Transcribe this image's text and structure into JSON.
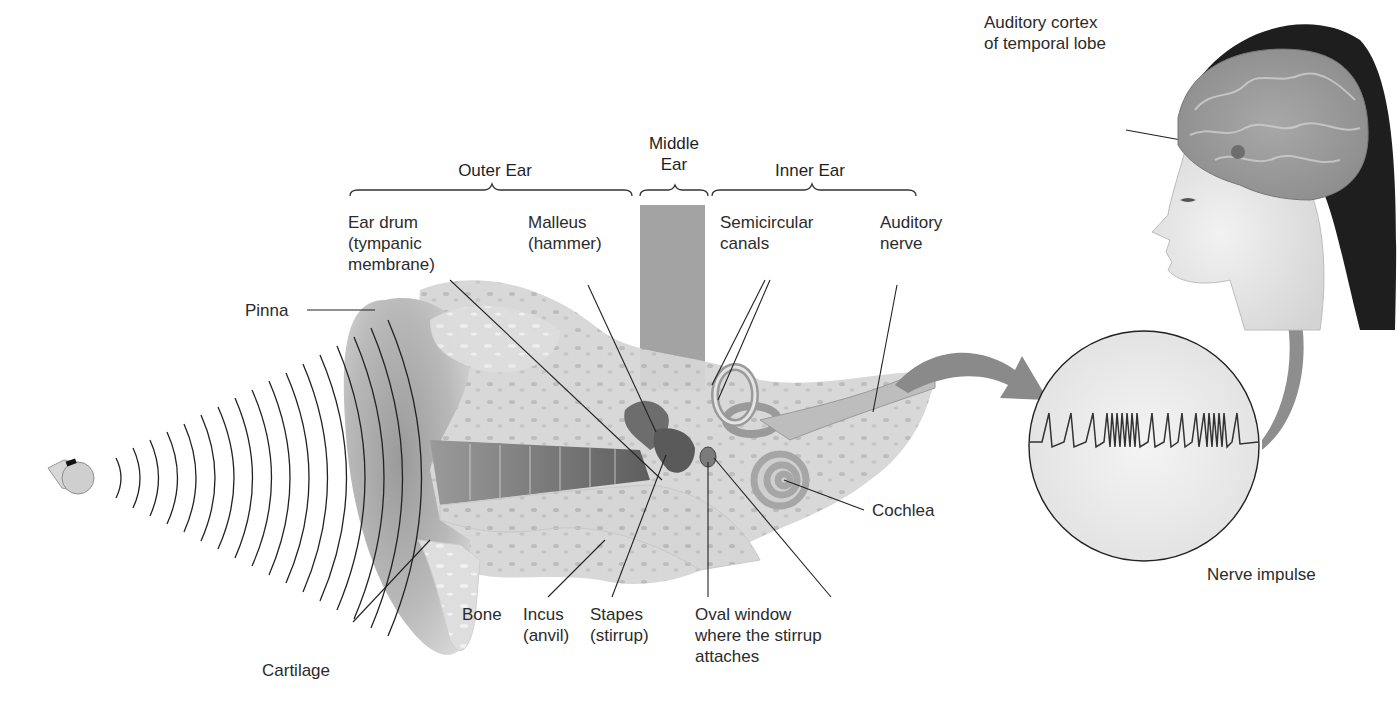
{
  "diagram": {
    "sections": {
      "outer_ear": "Outer Ear",
      "middle_ear": "Middle\nEar",
      "inner_ear": "Inner Ear"
    },
    "labels": {
      "ear_drum": "Ear drum\n(tympanic\nmembrane)",
      "malleus": "Malleus\n(hammer)",
      "semicircular_canals": "Semicircular\ncanals",
      "auditory_nerve": "Auditory\nnerve",
      "pinna": "Pinna",
      "cochlea": "Cochlea",
      "cartilage": "Cartilage",
      "bone": "Bone",
      "incus": "Incus\n(anvil)",
      "stapes": "Stapes\n(stirrup)",
      "oval_window": "Oval window\nwhere the stirrup\nattaches",
      "auditory_cortex": "Auditory cortex\nof temporal lobe",
      "nerve_impulse": "Nerve impulse"
    },
    "icons": {
      "sound_source": "whistle-icon",
      "sound_waves": "sound-wave-arcs",
      "head": "human-head-profile-with-brain",
      "inset": "nerve-impulse-circle-inset",
      "arrows": [
        "curved-arrow-to-inset",
        "curved-arrow-to-brain"
      ]
    },
    "colors": {
      "line": "#2a2a2a",
      "tissue_dark": "#8c8c8c",
      "tissue_mid": "#b4b4b4",
      "tissue_light": "#dcdcdc",
      "middle_ear_band": "#a3a3a3",
      "hair": "#1e1e1e",
      "arrow": "#8a8a8a"
    }
  }
}
